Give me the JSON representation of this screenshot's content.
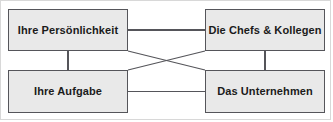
{
  "diagram": {
    "background_color": "#ffffff",
    "node_fill_color": "#e9e9e9",
    "node_border_color": "#55555a",
    "connector_color": "#55555a",
    "frame_color": "#d8d8d8",
    "nodes": [
      {
        "id": "personality",
        "label": "Ihre Persönlichkeit",
        "position": "top-left"
      },
      {
        "id": "bosses",
        "label": "Die Chefs & Kollegen",
        "position": "top-right"
      },
      {
        "id": "task",
        "label": "Ihre Aufgabe",
        "position": "bottom-left"
      },
      {
        "id": "company",
        "label": "Das Unternehmen",
        "position": "bottom-right"
      }
    ],
    "connectors": [
      {
        "id": "top-horizontal",
        "from": "personality",
        "to": "bosses",
        "kind": "straight"
      },
      {
        "id": "bottom-horizontal",
        "from": "task",
        "to": "company",
        "kind": "straight"
      },
      {
        "id": "left-vertical",
        "from": "personality",
        "to": "task",
        "kind": "straight"
      },
      {
        "id": "right-vertical",
        "from": "bosses",
        "to": "company",
        "kind": "straight"
      },
      {
        "id": "diagonal-tl-br",
        "from": "personality",
        "to": "company",
        "kind": "diagonal"
      },
      {
        "id": "diagonal-bl-tr",
        "from": "task",
        "to": "bosses",
        "kind": "diagonal"
      }
    ]
  }
}
